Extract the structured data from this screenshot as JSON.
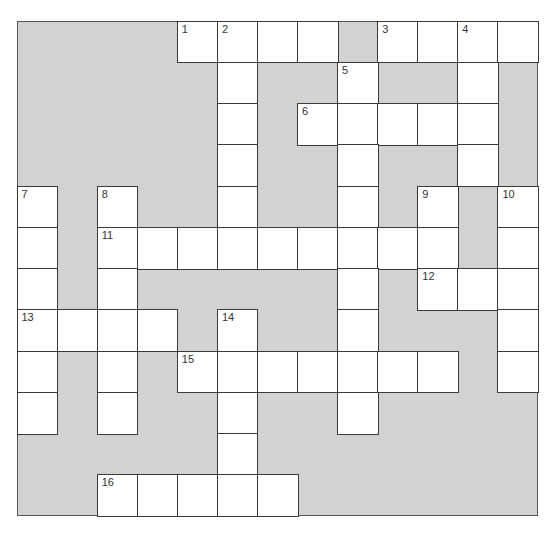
{
  "puzzle": {
    "rows": 12,
    "cols": 13,
    "colors": {
      "block": "#d2d2d2",
      "cell": "#ffffff",
      "border": "#3a3a3a",
      "number": "#333333"
    },
    "white_cells": [
      [
        0,
        4
      ],
      [
        0,
        5
      ],
      [
        0,
        6
      ],
      [
        0,
        7
      ],
      [
        0,
        9
      ],
      [
        0,
        10
      ],
      [
        0,
        11
      ],
      [
        0,
        12
      ],
      [
        1,
        5
      ],
      [
        1,
        8
      ],
      [
        1,
        11
      ],
      [
        2,
        5
      ],
      [
        2,
        7
      ],
      [
        2,
        8
      ],
      [
        2,
        9
      ],
      [
        2,
        10
      ],
      [
        2,
        11
      ],
      [
        3,
        5
      ],
      [
        3,
        8
      ],
      [
        3,
        11
      ],
      [
        4,
        0
      ],
      [
        4,
        2
      ],
      [
        4,
        5
      ],
      [
        4,
        8
      ],
      [
        4,
        10
      ],
      [
        4,
        12
      ],
      [
        5,
        0
      ],
      [
        5,
        2
      ],
      [
        5,
        3
      ],
      [
        5,
        4
      ],
      [
        5,
        5
      ],
      [
        5,
        6
      ],
      [
        5,
        7
      ],
      [
        5,
        8
      ],
      [
        5,
        9
      ],
      [
        5,
        10
      ],
      [
        5,
        12
      ],
      [
        6,
        0
      ],
      [
        6,
        2
      ],
      [
        6,
        8
      ],
      [
        6,
        10
      ],
      [
        6,
        11
      ],
      [
        6,
        12
      ],
      [
        7,
        0
      ],
      [
        7,
        1
      ],
      [
        7,
        2
      ],
      [
        7,
        3
      ],
      [
        7,
        5
      ],
      [
        7,
        8
      ],
      [
        7,
        12
      ],
      [
        8,
        0
      ],
      [
        8,
        2
      ],
      [
        8,
        4
      ],
      [
        8,
        5
      ],
      [
        8,
        6
      ],
      [
        8,
        7
      ],
      [
        8,
        8
      ],
      [
        8,
        9
      ],
      [
        8,
        10
      ],
      [
        8,
        12
      ],
      [
        9,
        0
      ],
      [
        9,
        2
      ],
      [
        9,
        5
      ],
      [
        9,
        8
      ],
      [
        10,
        5
      ],
      [
        11,
        2
      ],
      [
        11,
        3
      ],
      [
        11,
        4
      ],
      [
        11,
        5
      ],
      [
        11,
        6
      ]
    ],
    "numbers": [
      {
        "n": "1",
        "r": 0,
        "c": 4
      },
      {
        "n": "2",
        "r": 0,
        "c": 5
      },
      {
        "n": "3",
        "r": 0,
        "c": 9
      },
      {
        "n": "4",
        "r": 0,
        "c": 11
      },
      {
        "n": "5",
        "r": 1,
        "c": 8
      },
      {
        "n": "6",
        "r": 2,
        "c": 7
      },
      {
        "n": "7",
        "r": 4,
        "c": 0
      },
      {
        "n": "8",
        "r": 4,
        "c": 2
      },
      {
        "n": "9",
        "r": 4,
        "c": 10
      },
      {
        "n": "10",
        "r": 4,
        "c": 12
      },
      {
        "n": "11",
        "r": 5,
        "c": 2
      },
      {
        "n": "12",
        "r": 6,
        "c": 10
      },
      {
        "n": "13",
        "r": 7,
        "c": 0
      },
      {
        "n": "14",
        "r": 7,
        "c": 5
      },
      {
        "n": "15",
        "r": 8,
        "c": 4
      },
      {
        "n": "16",
        "r": 11,
        "c": 2
      }
    ]
  }
}
